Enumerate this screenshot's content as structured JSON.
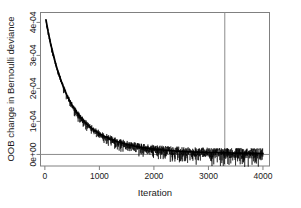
{
  "figure": {
    "background_color": "#ffffff",
    "frame_color": "#808080",
    "curve_color": "#000000",
    "reference_line_color": "#8c8c8c"
  },
  "chart_data": {
    "type": "line",
    "title": "",
    "subtitle": "",
    "xlabel": "Iteration",
    "ylabel": "OOB change in Bernoulli deviance",
    "xlim": [
      -80,
      4120
    ],
    "ylim": [
      -3.5e-05,
      0.00043
    ],
    "grid": false,
    "legend": null,
    "x_ticks": [
      0,
      1000,
      2000,
      3000,
      4000
    ],
    "x_tick_labels": [
      "0",
      "1000",
      "2000",
      "3000",
      "4000"
    ],
    "y_ticks": [
      0,
      0.0001,
      0.0002,
      0.0003,
      0.0004
    ],
    "y_tick_labels": [
      "0e+00",
      "1e-04",
      "2e-04",
      "3e-04",
      "4e-04"
    ],
    "annotations": [
      {
        "name": "best-iteration-vline",
        "type": "vline",
        "x": 3300,
        "label": ""
      },
      {
        "name": "zero-reference-hline",
        "type": "hline",
        "y": 0,
        "label": ""
      }
    ],
    "series": [
      {
        "name": "OOB change (smoothed trend)",
        "kind": "trend",
        "x": [
          20,
          60,
          100,
          150,
          200,
          250,
          300,
          350,
          400,
          450,
          500,
          550,
          600,
          650,
          700,
          750,
          800,
          850,
          900,
          950,
          1000,
          1100,
          1200,
          1300,
          1400,
          1500,
          1600,
          1700,
          1800,
          1900,
          2000,
          2200,
          2400,
          2600,
          2800,
          3000,
          3200,
          3400,
          3600,
          3800,
          4000
        ],
        "values": [
          0.000408,
          0.000372,
          0.00034,
          0.000305,
          0.000273,
          0.000246,
          0.000222,
          0.0002,
          0.000181,
          0.000164,
          0.000149,
          0.000136,
          0.000124,
          0.000113,
          0.000104,
          9.52e-05,
          8.75e-05,
          8.05e-05,
          7.42e-05,
          6.85e-05,
          6.33e-05,
          5.43e-05,
          4.68e-05,
          4.05e-05,
          3.52e-05,
          3.07e-05,
          2.68e-05,
          2.35e-05,
          2.07e-05,
          1.83e-05,
          1.62e-05,
          1.28e-05,
          1.03e-05,
          8.4e-06,
          7e-06,
          5.9e-06,
          5.1e-06,
          4.4e-06,
          3.9e-06,
          3.5e-06,
          3.1e-06
        ]
      },
      {
        "name": "OOB change (per-iteration, noisy)",
        "kind": "noise-band",
        "noise_amplitude_start": 4.5e-06,
        "noise_amplitude_end": 1.65e-05,
        "description": "High-frequency per-iteration fluctuation around the trend, widening as the trend flattens."
      }
    ]
  }
}
